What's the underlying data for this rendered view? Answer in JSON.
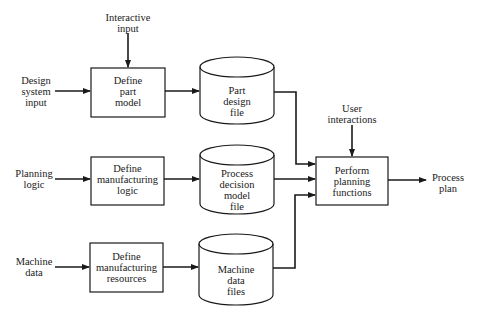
{
  "diagram": {
    "title": "",
    "inputs": {
      "design_system_input": "Design\nsystem\ninput",
      "interactive_input": "Interactive\ninput",
      "planning_logic": "Planning\nlogic",
      "machine_data": "Machine\ndata",
      "user_interactions": "User\ninteractions"
    },
    "processes": [
      {
        "id": "define-part-model",
        "label": "Define\npart\nmodel"
      },
      {
        "id": "define-manufacturing-logic",
        "label": "Define\nmanufacturing\nlogic"
      },
      {
        "id": "define-manufacturing-resources",
        "label": "Define\nmanufacturing\nresources"
      },
      {
        "id": "perform-planning-functions",
        "label": "Perform\nplanning\nfunctions"
      }
    ],
    "data_stores": [
      {
        "id": "part-design-file",
        "label": "Part\ndesign\nfile"
      },
      {
        "id": "process-decision-model-file",
        "label": "Process\ndecision\nmodel\nfile"
      },
      {
        "id": "machine-data-files",
        "label": "Machine\ndata\nfiles"
      }
    ],
    "output": {
      "process_plan": "Process\nplan"
    },
    "colors": {
      "line": "#1a1a1a",
      "background": "#ffffff"
    }
  }
}
